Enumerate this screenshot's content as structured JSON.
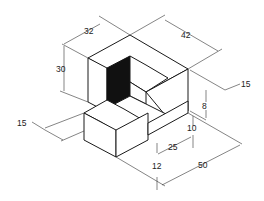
{
  "drawing": {
    "type": "isometric technical drawing",
    "subject": "stepped L-shaped block",
    "colors": {
      "line": "#1a1a1a",
      "background": "#ffffff",
      "shadow": "#111111"
    }
  },
  "dimensions": {
    "depth_top": "32",
    "width_top": "42",
    "height_left": "30",
    "right_offset": "15",
    "step_height": "8",
    "lower_height": "10",
    "step_depth": "25",
    "front_offset": "12",
    "base_length": "50",
    "front_block_width": "15"
  }
}
